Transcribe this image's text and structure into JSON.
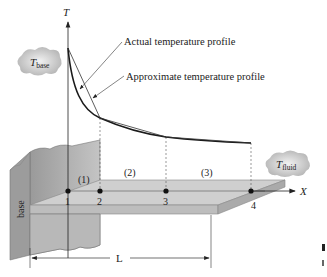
{
  "axes": {
    "y_label": "T",
    "x_label": "X"
  },
  "clouds": {
    "base": {
      "main": "T",
      "sub": "base"
    },
    "fluid": {
      "main": "T",
      "sub": "fluid"
    }
  },
  "annotations": {
    "actual": "Actual temperature profile",
    "approximate": "Approximate temperature profile"
  },
  "elements": [
    "(1)",
    "(2)",
    "(3)"
  ],
  "nodes": [
    "1",
    "2",
    "3",
    "4"
  ],
  "base_label": "base",
  "length_label": "L",
  "colors": {
    "line": "#1a1a1a",
    "fin_top": "#c9c9c9",
    "fin_front": "#b5b5b5",
    "base_face": "#a9a9a9",
    "cloud": "#bdbdbd"
  }
}
